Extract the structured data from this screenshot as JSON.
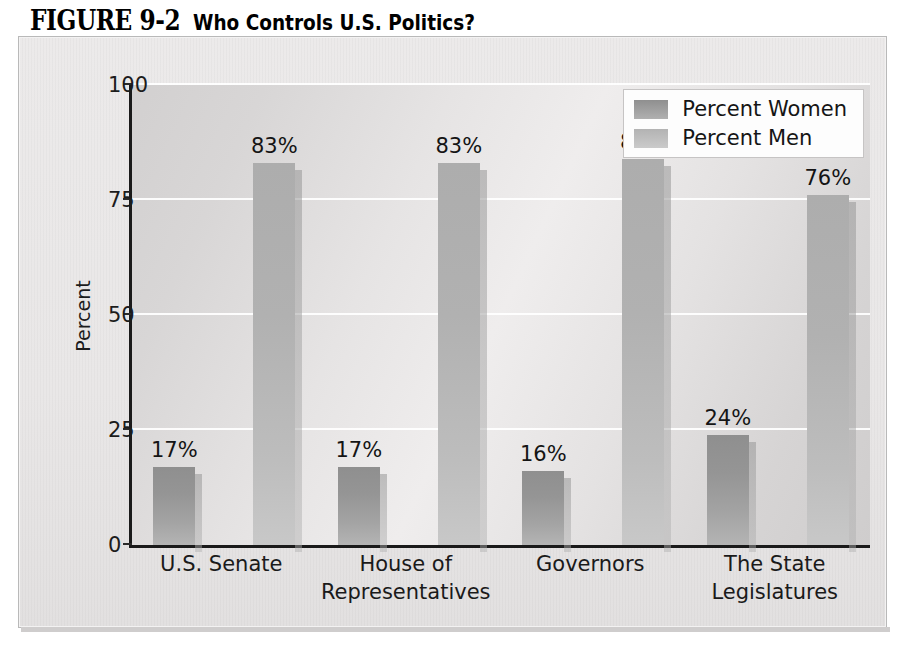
{
  "figure": {
    "label": "FIGURE 9-2",
    "caption": "Who Controls U.S. Politics?"
  },
  "chart_data": {
    "type": "bar",
    "title": "Who Controls U.S. Politics?",
    "xlabel": "",
    "ylabel": "Percent",
    "ylim": [
      0,
      100
    ],
    "yticks": [
      0,
      25,
      50,
      75,
      100
    ],
    "ytick_labels": [
      "0",
      "25",
      "50",
      "75",
      "100"
    ],
    "grid": true,
    "legend_position": "top-right",
    "categories": [
      "U.S. Senate",
      "House of Representatives",
      "Governors",
      "The State Legislatures"
    ],
    "category_lines": [
      [
        "U.S. Senate"
      ],
      [
        "House of",
        "Representatives"
      ],
      [
        "Governors"
      ],
      [
        "The State",
        "Legislatures"
      ]
    ],
    "series": [
      {
        "name": "Percent Women",
        "color": "#989898",
        "values": [
          17,
          17,
          16,
          24
        ],
        "labels": [
          "17%",
          "17%",
          "16%",
          "24%"
        ]
      },
      {
        "name": "Percent Men",
        "color": "#bcbcbc",
        "values": [
          83,
          83,
          84,
          76
        ],
        "labels": [
          "83%",
          "83%",
          "84%",
          "76%"
        ]
      }
    ]
  },
  "legend": {
    "items": [
      {
        "label": "Percent Women",
        "key": "women"
      },
      {
        "label": "Percent Men",
        "key": "men"
      }
    ]
  }
}
